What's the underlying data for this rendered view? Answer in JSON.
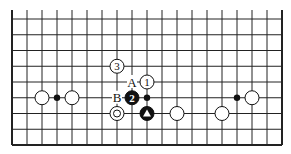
{
  "board": {
    "columns": 19,
    "rows": 9,
    "origin_x": 12,
    "origin_y": 19,
    "col_spacing": 15,
    "row_spacing": 15.75,
    "top_open": true,
    "line_color": "#222222",
    "stone_black": "#111111",
    "stone_white": "#ffffff"
  },
  "stones": [
    {
      "col": 2,
      "row": 5,
      "color": "white",
      "label": ""
    },
    {
      "col": 4,
      "row": 5,
      "color": "white",
      "label": ""
    },
    {
      "col": 7,
      "row": 3,
      "color": "white",
      "label": "3"
    },
    {
      "col": 9,
      "row": 4,
      "color": "white",
      "label": "1"
    },
    {
      "col": 8,
      "row": 5,
      "color": "black",
      "label": "2"
    },
    {
      "col": 7,
      "row": 6,
      "color": "white",
      "label": "",
      "marker": "circle"
    },
    {
      "col": 9,
      "row": 6,
      "color": "black",
      "label": "",
      "marker": "triangle"
    },
    {
      "col": 11,
      "row": 6,
      "color": "white",
      "label": ""
    },
    {
      "col": 14,
      "row": 6,
      "color": "white",
      "label": ""
    },
    {
      "col": 16,
      "row": 5,
      "color": "white",
      "label": ""
    }
  ],
  "dots": [
    {
      "col": 3,
      "row": 5
    },
    {
      "col": 9,
      "row": 5
    },
    {
      "col": 15,
      "row": 5
    }
  ],
  "letters": [
    {
      "col": 8,
      "row": 4,
      "text": "A"
    },
    {
      "col": 7,
      "row": 5,
      "text": "B"
    }
  ]
}
